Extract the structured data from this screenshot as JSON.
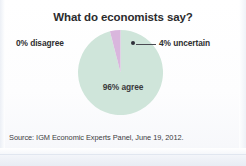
{
  "figure": {
    "title": "What do economists say?",
    "source": "Source: IGM Economic Experts Panel, June 19, 2012."
  },
  "labels": {
    "disagree": "0% disagree",
    "uncertain": "4% uncertain",
    "agree": "96% agree"
  },
  "colors": {
    "agree_slice": "#cfe5da",
    "uncertain_slice": "#d9b6dd",
    "text": "#2b2b2d",
    "leader_line": "#4a4a52",
    "background": "#ffffff"
  },
  "chart_data": {
    "type": "pie",
    "title": "What do economists say?",
    "labels": [
      "96% agree",
      "4% uncertain",
      "0% disagree"
    ],
    "values": [
      96,
      4,
      0
    ],
    "units": "percent",
    "colors": [
      "#cfe5da",
      "#d9b6dd",
      "#cfe5da"
    ],
    "legend": "none",
    "annotations": [
      {
        "text": "0% disagree",
        "position": "left-of-pie",
        "leader_line": false
      },
      {
        "text": "4% uncertain",
        "position": "right-of-pie",
        "leader_line": true
      },
      {
        "text": "96% agree",
        "position": "inside-pie-center",
        "leader_line": false
      }
    ],
    "source": "Source: IGM Economic Experts Panel, June 19, 2012.",
    "start_angle_deg": 0,
    "direction": "clockwise"
  }
}
